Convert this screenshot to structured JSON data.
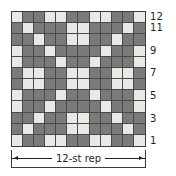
{
  "chart_data": {
    "type": "heatmap",
    "title": "",
    "xlabel": "",
    "ylabel": "",
    "columns": 12,
    "rows": 12,
    "grid_legend": {
      "dark": "MC (dark square)",
      "light": "CC (light square)"
    },
    "colors": {
      "dark": "#7a7a7a",
      "light": "#e8e8e4",
      "gridline": "#4a4a4a",
      "border": "#3c3c3c",
      "text": "#231f20"
    },
    "column_order": "right-to-left (st 1 at right)",
    "row_order": "bottom-to-top (row 1 at bottom)",
    "row_tick_labels": [
      "12",
      "11",
      "9",
      "7",
      "5",
      "3",
      "1"
    ],
    "row_tick_rows": [
      12,
      11,
      9,
      7,
      5,
      3,
      1
    ],
    "repeat_label": "12-st rep",
    "rows_data": [
      {
        "row": 12,
        "cells": [
          "light",
          "dark",
          "dark",
          "light",
          "light",
          "dark",
          "dark",
          "light",
          "light",
          "dark",
          "dark",
          "light"
        ]
      },
      {
        "row": 11,
        "cells": [
          "dark",
          "light",
          "dark",
          "dark",
          "dark",
          "light",
          "light",
          "dark",
          "dark",
          "dark",
          "light",
          "dark"
        ]
      },
      {
        "row": 10,
        "cells": [
          "dark",
          "dark",
          "light",
          "dark",
          "dark",
          "light",
          "light",
          "dark",
          "dark",
          "light",
          "dark",
          "dark"
        ]
      },
      {
        "row": 9,
        "cells": [
          "light",
          "dark",
          "dark",
          "light",
          "dark",
          "dark",
          "dark",
          "dark",
          "light",
          "dark",
          "dark",
          "light"
        ]
      },
      {
        "row": 8,
        "cells": [
          "light",
          "dark",
          "dark",
          "dark",
          "light",
          "dark",
          "dark",
          "light",
          "dark",
          "dark",
          "dark",
          "light"
        ]
      },
      {
        "row": 7,
        "cells": [
          "dark",
          "light",
          "light",
          "dark",
          "dark",
          "light",
          "light",
          "dark",
          "dark",
          "light",
          "light",
          "dark"
        ]
      },
      {
        "row": 6,
        "cells": [
          "dark",
          "light",
          "light",
          "dark",
          "dark",
          "light",
          "light",
          "dark",
          "dark",
          "light",
          "light",
          "dark"
        ]
      },
      {
        "row": 5,
        "cells": [
          "light",
          "dark",
          "dark",
          "dark",
          "light",
          "dark",
          "dark",
          "light",
          "dark",
          "dark",
          "dark",
          "light"
        ]
      },
      {
        "row": 4,
        "cells": [
          "light",
          "dark",
          "dark",
          "light",
          "dark",
          "dark",
          "dark",
          "dark",
          "light",
          "dark",
          "dark",
          "light"
        ]
      },
      {
        "row": 3,
        "cells": [
          "dark",
          "dark",
          "light",
          "dark",
          "dark",
          "light",
          "light",
          "dark",
          "dark",
          "light",
          "dark",
          "dark"
        ]
      },
      {
        "row": 2,
        "cells": [
          "dark",
          "light",
          "dark",
          "dark",
          "dark",
          "light",
          "light",
          "dark",
          "dark",
          "dark",
          "light",
          "dark"
        ]
      },
      {
        "row": 1,
        "cells": [
          "light",
          "dark",
          "dark",
          "light",
          "light",
          "dark",
          "dark",
          "light",
          "light",
          "dark",
          "dark",
          "light"
        ]
      }
    ]
  }
}
